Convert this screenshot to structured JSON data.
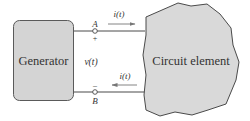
{
  "diagram": {
    "generator": {
      "label": "Generator",
      "fill": "#d4d4d4",
      "stroke": "#5a5a5a"
    },
    "circuit_element": {
      "label": "Circuit element",
      "fill": "#d9d9d9",
      "stroke": "#4a4a4a"
    },
    "terminals": {
      "top": {
        "label": "A",
        "polarity": "+"
      },
      "bottom": {
        "label": "B",
        "polarity": "–"
      }
    },
    "voltage": {
      "label": "v(t)"
    },
    "currents": {
      "top": {
        "label": "i(t)",
        "direction": "right"
      },
      "bottom": {
        "label": "i(t)",
        "direction": "left"
      }
    },
    "wire_color": "#4a4a4a",
    "arrow_color": "#777777"
  }
}
